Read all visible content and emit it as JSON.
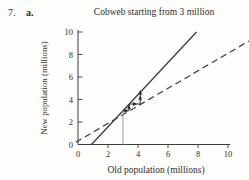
{
  "page": {
    "problem_number": "7.",
    "part_label": "a."
  },
  "chart_data": {
    "type": "line",
    "title": "Cobweb starting from 3 million",
    "xlabel": "Old population (millions)",
    "ylabel": "New population (millions)",
    "xlim": [
      0,
      10
    ],
    "ylim": [
      0,
      10
    ],
    "xticks": [
      0,
      2,
      4,
      6,
      8,
      10
    ],
    "yticks": [
      0,
      2,
      4,
      6,
      8,
      10
    ],
    "grid": false,
    "legend": "none",
    "series": [
      {
        "name": "population-update-line",
        "style": "solid",
        "points": [
          [
            0.9,
            0
          ],
          [
            7.9,
            10
          ]
        ]
      },
      {
        "name": "equilibrium-diagonal-line",
        "style": "dashed",
        "points": [
          [
            -0.15,
            0.2
          ],
          [
            11.4,
            9.2
          ]
        ]
      },
      {
        "name": "starting-value-line",
        "style": "gray-vertical",
        "points": [
          [
            3,
            0
          ],
          [
            3,
            3.0
          ]
        ]
      },
      {
        "name": "cobweb-steps",
        "style": "arrow-steps",
        "points": [
          [
            3,
            3.0
          ],
          [
            3.4,
            3.0
          ],
          [
            3.4,
            3.6
          ],
          [
            4.15,
            3.6
          ],
          [
            4.15,
            4.65
          ]
        ]
      }
    ],
    "colors": {
      "line": "#3c3c3c",
      "cobweb": "#2b2b2b",
      "start_line": "#9a9a9a",
      "text": "#2f2f2f"
    }
  }
}
